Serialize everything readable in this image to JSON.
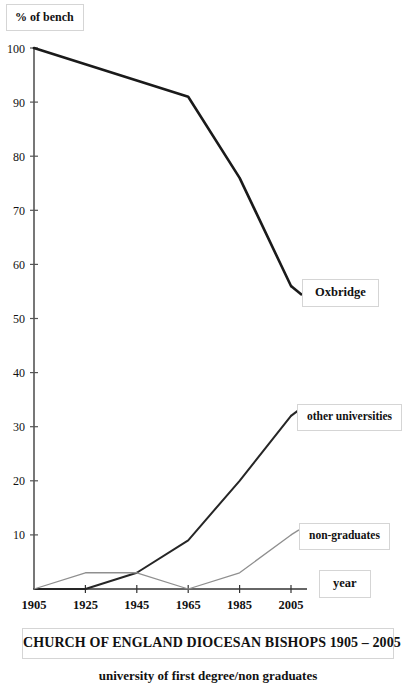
{
  "chart_data": {
    "type": "line",
    "title": "CHURCH OF ENGLAND DIOCESAN BISHOPS 1905 – 2005",
    "subtitle": "university of first degree/non graduates",
    "xlabel": "year",
    "ylabel": "% of bench",
    "categories": [
      "1905",
      "1925",
      "1945",
      "1965",
      "1985",
      "2005"
    ],
    "x": [
      1905,
      1925,
      1945,
      1965,
      1985,
      2005
    ],
    "xlim": [
      1905,
      2005
    ],
    "ylim": [
      0,
      100
    ],
    "y_ticks": [
      "100",
      "90",
      "80",
      "70",
      "60",
      "50",
      "40",
      "30",
      "20",
      "10"
    ],
    "y_tick_values": [
      100,
      90,
      80,
      70,
      60,
      50,
      40,
      30,
      20,
      10
    ],
    "grid": false,
    "legend_position": "right-inline",
    "series": [
      {
        "name": "Oxbridge",
        "values": [
          100,
          97,
          94,
          91,
          76,
          56
        ],
        "color": "#1a1a1a",
        "width": 2.6
      },
      {
        "name": "other universities",
        "values": [
          0,
          0,
          3,
          9,
          20,
          32
        ],
        "color": "#262626",
        "width": 2.0
      },
      {
        "name": "non-graduates",
        "values": [
          0,
          3,
          3,
          0,
          3,
          10
        ],
        "color": "#8f8f8f",
        "width": 1.3
      }
    ]
  },
  "axis": {
    "y_label_boxed": "% of bench",
    "x_label_boxed": "year"
  },
  "legend": {
    "oxbridge": "Oxbridge",
    "other_universities": "other universities",
    "non_graduates": "non-graduates"
  },
  "caption": {
    "title": "CHURCH OF ENGLAND DIOCESAN BISHOPS 1905 – 2005",
    "subtitle": "university of first degree/non graduates"
  }
}
